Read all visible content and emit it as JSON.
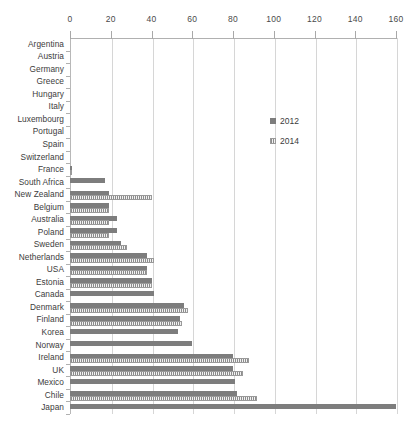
{
  "chart_data": {
    "type": "bar",
    "orientation": "horizontal",
    "title": "",
    "xlabel": "",
    "ylabel": "",
    "xlim": [
      0,
      160
    ],
    "xticks": [
      0,
      20,
      40,
      60,
      80,
      100,
      120,
      140,
      160
    ],
    "grid": true,
    "legend_position": "upper right",
    "categories": [
      "Argentina",
      "Austria",
      "Germany",
      "Greece",
      "Hungary",
      "Italy",
      "Luxembourg",
      "Portugal",
      "Spain",
      "Switzerland",
      "France",
      "South Africa",
      "New Zealand",
      "Belgium",
      "Australia",
      "Poland",
      "Sweden",
      "Netherlands",
      "USA",
      "Estonia",
      "Canada",
      "Denmark",
      "Finland",
      "Korea",
      "Norway",
      "Ireland",
      "UK",
      "Mexico",
      "Chile",
      "Japan"
    ],
    "series": [
      {
        "name": "2012",
        "color": "#7d7d7d",
        "values": [
          0,
          0,
          0,
          0,
          0,
          0,
          0,
          0,
          0,
          0,
          1,
          17,
          19,
          19,
          23,
          23,
          25,
          38,
          38,
          40,
          41,
          56,
          54,
          53,
          60,
          80,
          80,
          81,
          82,
          160
        ]
      },
      {
        "name": "2014",
        "color": "#8c8c8c",
        "values": [
          0,
          0,
          0,
          0,
          0,
          0,
          0,
          0,
          0,
          0,
          1,
          0,
          40,
          19,
          19,
          19,
          28,
          41,
          38,
          40,
          0,
          58,
          55,
          0,
          0,
          88,
          85,
          0,
          92,
          0
        ]
      }
    ]
  },
  "legend": {
    "entries": [
      {
        "label": "2012"
      },
      {
        "label": "2014"
      }
    ]
  }
}
